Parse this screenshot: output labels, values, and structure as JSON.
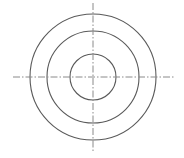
{
  "diagram": {
    "type": "concentric-circles-with-centerlines",
    "background": "#ffffff",
    "center": {
      "x": 93,
      "y": 77
    },
    "circles": [
      {
        "name": "outer",
        "r": 63,
        "stroke": "#5a5a5a"
      },
      {
        "name": "middle",
        "r": 46,
        "stroke": "#5a5a5a"
      },
      {
        "name": "inner",
        "r": 23,
        "stroke": "#5a5a5a"
      }
    ],
    "centerlines": {
      "stroke": "#8a8a8a",
      "dasharray": "7 2 1.5 2",
      "horizontal": {
        "x1": 13,
        "x2": 175,
        "y": 77
      },
      "vertical": {
        "x": 93,
        "y1": 3,
        "y2": 151
      }
    }
  }
}
